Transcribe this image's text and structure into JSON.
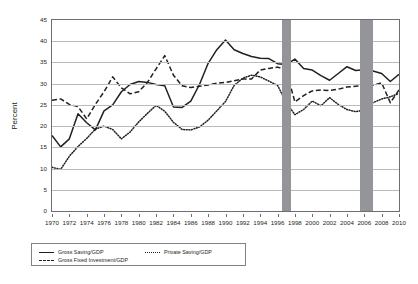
{
  "chart_data": {
    "type": "line",
    "title": "",
    "xlabel": "",
    "ylabel": "Percent",
    "xlim": [
      1970,
      2010
    ],
    "ylim": [
      0,
      45
    ],
    "grid": true,
    "legend_position": "bottom-left",
    "x": [
      1970,
      1971,
      1972,
      1973,
      1974,
      1975,
      1976,
      1977,
      1978,
      1979,
      1980,
      1981,
      1982,
      1983,
      1984,
      1985,
      1986,
      1987,
      1988,
      1989,
      1990,
      1991,
      1992,
      1993,
      1994,
      1995,
      1996,
      1997,
      1998,
      1999,
      2000,
      2001,
      2002,
      2003,
      2004,
      2005,
      2006,
      2007,
      2008,
      2009,
      2010
    ],
    "y_ticks": [
      0,
      5,
      10,
      15,
      20,
      25,
      30,
      35,
      40,
      45
    ],
    "x_ticks": [
      1970,
      1972,
      1974,
      1976,
      1978,
      1980,
      1982,
      1984,
      1986,
      1988,
      1990,
      1992,
      1994,
      1996,
      1998,
      2000,
      2002,
      2004,
      2006,
      2008,
      2010
    ],
    "series": [
      {
        "name": "Gross Saving/GDP",
        "style": "solid",
        "color": "#231f20",
        "values": [
          17.8,
          15.1,
          17.0,
          22.9,
          20.8,
          19.1,
          23.6,
          25.0,
          28.1,
          29.8,
          30.5,
          30.3,
          29.8,
          29.5,
          24.5,
          24.4,
          25.9,
          29.8,
          34.8,
          38.0,
          40.3,
          38.0,
          37.1,
          36.4,
          36.0,
          35.9,
          34.7,
          34.5,
          35.8,
          33.6,
          33.2,
          31.9,
          30.8,
          32.4,
          34.0,
          33.1,
          33.3,
          33.0,
          32.4,
          30.5,
          32.2
        ]
      },
      {
        "name": "Gross Fixed Investment/GDP",
        "style": "dashed",
        "color": "#231f20",
        "values": [
          26.1,
          26.4,
          25.1,
          24.6,
          21.7,
          25.1,
          28.1,
          31.6,
          29.0,
          27.6,
          28.1,
          30.3,
          33.5,
          36.6,
          32.0,
          29.5,
          29.1,
          29.4,
          29.7,
          30.1,
          30.3,
          30.7,
          31.1,
          31.1,
          33.2,
          33.6,
          33.9,
          33.2,
          25.7,
          27.2,
          28.3,
          28.5,
          28.4,
          28.7,
          29.2,
          29.4,
          29.5,
          29.6,
          30.2,
          25.5,
          28.5
        ]
      },
      {
        "name": "Private Saving/GDP",
        "style": "dotted",
        "color": "#231f20",
        "values": [
          10.3,
          9.8,
          12.9,
          15.2,
          17.1,
          19.3,
          20.0,
          19.2,
          17.0,
          18.6,
          21.0,
          23.0,
          24.9,
          23.5,
          20.9,
          19.2,
          19.1,
          19.8,
          21.4,
          23.6,
          25.8,
          29.6,
          31.3,
          32.0,
          31.6,
          30.6,
          29.6,
          25.6,
          22.7,
          23.9,
          25.9,
          24.8,
          26.7,
          25.1,
          23.9,
          23.4,
          23.8,
          25.5,
          26.4,
          26.9,
          27.7
        ]
      }
    ],
    "shaded_bands": [
      {
        "name": "asian-financial-crisis-band",
        "start": 1996.55,
        "end": 1997.6,
        "color": "#939598"
      },
      {
        "name": "second-highlight-band",
        "start": 2005.45,
        "end": 2006.95,
        "color": "#939598"
      }
    ]
  }
}
